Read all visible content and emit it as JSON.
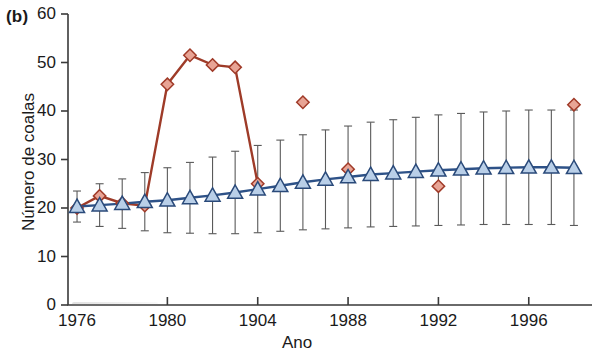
{
  "figure": {
    "panel_label": "(b)",
    "xlabel": "Ano",
    "ylabel": "Número de coalas"
  },
  "colors": {
    "red_marker_fill": "#e8a495",
    "red_marker_stroke": "#a03a28",
    "red_line": "#9e3b28",
    "blue_marker_fill": "#b9cfe8",
    "blue_marker_stroke": "#2a4a7a",
    "blue_line": "#2e5288",
    "axis": "#3a3a3a",
    "errorbar": "#5a5a5a"
  },
  "chart_data": {
    "type": "line",
    "title": "",
    "panel": "(b)",
    "xlabel": "Ano",
    "ylabel": "Número de coalas",
    "xlim": [
      1975.6,
      1998.8
    ],
    "ylim": [
      0,
      60
    ],
    "ytick_labels": [
      "0",
      "10",
      "20",
      "30",
      "40",
      "50",
      "60"
    ],
    "yticks": [
      0,
      10,
      20,
      30,
      40,
      50,
      60
    ],
    "xtick_labels": [
      "1976",
      "1980",
      "1904",
      "1988",
      "1992",
      "1996"
    ],
    "xticks": [
      1976,
      1980,
      1984,
      1988,
      1992,
      1996
    ],
    "grid": false,
    "legend": "none",
    "series": [
      {
        "name": "observado",
        "marker": "diamond",
        "color": "#e8a495",
        "connected": true,
        "x": [
          1976,
          1977,
          1978,
          1979,
          1980,
          1981,
          1982,
          1983,
          1984
        ],
        "values": [
          20.0,
          22.5,
          21.0,
          20.5,
          45.5,
          51.5,
          49.5,
          49.0,
          25.0
        ]
      },
      {
        "name": "observado-isolado",
        "marker": "diamond",
        "color": "#e8a495",
        "connected": false,
        "x": [
          1986,
          1988,
          1992,
          1998
        ],
        "values": [
          41.8,
          28.0,
          24.5,
          41.3
        ]
      },
      {
        "name": "modelo",
        "marker": "triangle",
        "color": "#b9cfe8",
        "connected": true,
        "errorbars": true,
        "x": [
          1976,
          1977,
          1978,
          1979,
          1980,
          1981,
          1982,
          1983,
          1984,
          1985,
          1986,
          1987,
          1988,
          1989,
          1990,
          1991,
          1992,
          1993,
          1994,
          1995,
          1996,
          1997,
          1998
        ],
        "values": [
          20.3,
          20.6,
          20.9,
          21.3,
          21.6,
          22.1,
          22.6,
          23.2,
          23.9,
          24.6,
          25.3,
          25.9,
          26.4,
          26.9,
          27.2,
          27.5,
          27.8,
          28.0,
          28.2,
          28.3,
          28.4,
          28.4,
          28.3
        ],
        "err_low": [
          3.2,
          4.4,
          5.1,
          6.0,
          6.7,
          7.3,
          7.9,
          8.5,
          9.0,
          9.4,
          9.8,
          10.2,
          10.5,
          10.8,
          11.0,
          11.2,
          11.4,
          11.5,
          11.6,
          11.7,
          11.8,
          11.8,
          11.9
        ],
        "err_high": [
          3.2,
          4.4,
          5.1,
          6.0,
          6.7,
          7.3,
          7.9,
          8.5,
          9.0,
          9.4,
          9.8,
          10.2,
          10.5,
          10.8,
          11.0,
          11.2,
          11.4,
          11.5,
          11.6,
          11.7,
          11.8,
          11.8,
          11.9
        ]
      }
    ]
  }
}
